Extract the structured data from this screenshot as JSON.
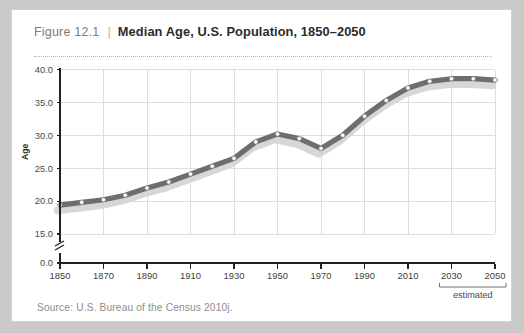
{
  "figure": {
    "number": "Figure 12.1",
    "separator": "|",
    "title": "Median Age, U.S. Population, 1850–2050",
    "source": "Source:  U.S. Bureau of the Census 2010j."
  },
  "colors": {
    "page_background": "#c9c9c9",
    "card_background": "#ffffff",
    "card_border": "#d2d2d2",
    "line": "#6e6e6e",
    "line_shadow": "#d5d5d5",
    "marker_fill": "#ffffff",
    "marker_stroke": "#8a8a8a",
    "grid": "#dedede",
    "axis": "#222222",
    "title_number": "#7b7b7b",
    "title_text": "#2b2b2b",
    "source_text": "#8d8d8d"
  },
  "chart_data": {
    "type": "line",
    "title": "Median Age, U.S. Population, 1850–2050",
    "xlabel": "",
    "ylabel": "Age",
    "xlim": [
      1850,
      2050
    ],
    "ylim": [
      15.0,
      40.0
    ],
    "y_axis_break": true,
    "y_break_below": 15.0,
    "grid": true,
    "legend": false,
    "yticks": [
      "0.0",
      "15.0",
      "20.0",
      "25.0",
      "30.0",
      "35.0",
      "40.0"
    ],
    "ytick_values": [
      0.0,
      15.0,
      20.0,
      25.0,
      30.0,
      35.0,
      40.0
    ],
    "xticks": [
      "1850",
      "1870",
      "1890",
      "1910",
      "1930",
      "1950",
      "1970",
      "1990",
      "2010",
      "2030",
      "2050"
    ],
    "xtick_values": [
      1850,
      1870,
      1890,
      1910,
      1930,
      1950,
      1970,
      1990,
      2010,
      2030,
      2050
    ],
    "annotation": {
      "label": "estimated",
      "span": [
        2030,
        2050
      ]
    },
    "x": [
      1850,
      1860,
      1870,
      1880,
      1890,
      1900,
      1910,
      1920,
      1930,
      1940,
      1950,
      1960,
      1970,
      1980,
      1990,
      2000,
      2010,
      2020,
      2030,
      2040,
      2050
    ],
    "series": [
      {
        "name": "Median Age",
        "values": [
          19.4,
          19.8,
          20.2,
          20.9,
          22.0,
          22.9,
          24.1,
          25.3,
          26.5,
          29.0,
          30.2,
          29.5,
          28.0,
          30.0,
          32.9,
          35.3,
          37.2,
          38.2,
          38.6,
          38.6,
          38.4
        ]
      }
    ]
  }
}
